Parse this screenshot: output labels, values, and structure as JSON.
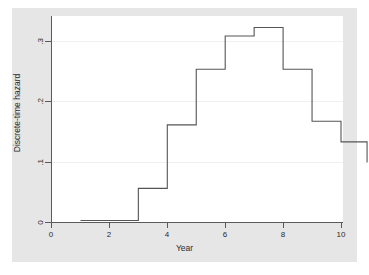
{
  "chart_data": {
    "type": "line",
    "subtype": "step-post",
    "title": "",
    "xlabel": "Year",
    "ylabel": "Discrete-time hazard",
    "xlim": [
      0,
      10.4
    ],
    "ylim": [
      0,
      0.34
    ],
    "xticks": [
      0,
      2,
      4,
      6,
      8,
      10
    ],
    "xtick_labels": [
      "0",
      "2",
      "4",
      "6",
      "8",
      "10"
    ],
    "yticks": [
      0,
      0.1,
      0.2,
      0.3
    ],
    "ytick_labels": [
      "0",
      ".1",
      ".2",
      ".3"
    ],
    "grid": "horizontal",
    "legend": "none",
    "x": [
      1,
      2,
      3,
      4,
      5,
      6,
      7,
      8,
      9,
      10
    ],
    "values": [
      0.003,
      0.003,
      0.056,
      0.161,
      0.253,
      0.308,
      0.322,
      0.253,
      0.167,
      0.133
    ],
    "series": [
      {
        "name": "Discrete-time hazard",
        "color": "#555555",
        "values": [
          0.003,
          0.003,
          0.056,
          0.161,
          0.253,
          0.308,
          0.322,
          0.253,
          0.167,
          0.133
        ]
      }
    ],
    "points": [
      {
        "year": 1,
        "hazard": 0.003
      },
      {
        "year": 2,
        "hazard": 0.003
      },
      {
        "year": 3,
        "hazard": 0.056
      },
      {
        "year": 4,
        "hazard": 0.161
      },
      {
        "year": 5,
        "hazard": 0.253
      },
      {
        "year": 6,
        "hazard": 0.308
      },
      {
        "year": 7,
        "hazard": 0.322
      },
      {
        "year": 8,
        "hazard": 0.253
      },
      {
        "year": 9,
        "hazard": 0.167
      },
      {
        "year": 10,
        "hazard": 0.133
      }
    ],
    "colors": {
      "line": "#555555",
      "axis": "#5a5a5a",
      "grid": "#f0f0f0",
      "plot_background": "#ffffff",
      "graph_background": "#e6e6e6",
      "page_background": "#ffffff",
      "text": "#2b2b2b"
    }
  },
  "axes": {
    "x_title": "Year",
    "y_title": "Discrete-time hazard",
    "x_tick_labels": [
      "0",
      "2",
      "4",
      "6",
      "8",
      "10"
    ],
    "y_tick_labels": [
      "0",
      ".1",
      ".2",
      ".3"
    ]
  }
}
